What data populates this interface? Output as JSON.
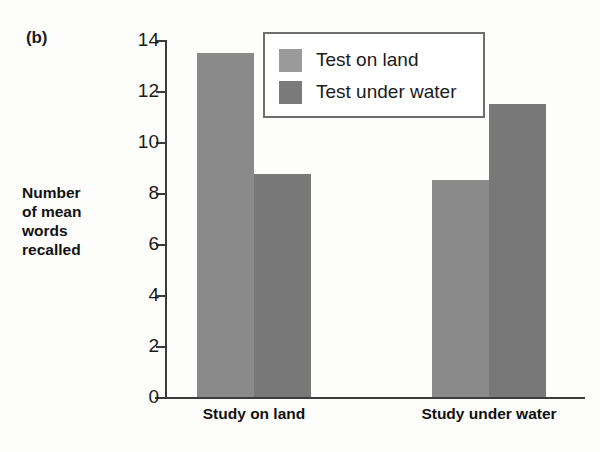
{
  "figure": {
    "panel_label": "(b)",
    "y_axis_title_lines": [
      "Number",
      "of mean",
      "words",
      "recalled"
    ]
  },
  "chart_data": {
    "type": "bar",
    "title": "",
    "xlabel": "",
    "ylabel": "Number of mean words recalled",
    "categories": [
      "Study on land",
      "Study under water"
    ],
    "series": [
      {
        "name": "Test on land",
        "values": [
          13.5,
          8.5
        ],
        "color": "#8a8a8a"
      },
      {
        "name": "Test under water",
        "values": [
          8.75,
          11.5
        ],
        "color": "#787878"
      }
    ],
    "ylim": [
      0,
      14
    ],
    "yticks": [
      0,
      2,
      4,
      6,
      8,
      10,
      12,
      14
    ],
    "ytick_labels": [
      "0",
      "2",
      "4",
      "6",
      "8",
      "10",
      "12",
      "14"
    ],
    "grid": false,
    "legend_position": "top-center",
    "legend_entries": [
      "Test on land",
      "Test under water"
    ]
  },
  "colors": {
    "axis": "#3b3b3b",
    "text": "#111111",
    "legend_border": "#6e6e6e",
    "bar_light": "#8a8a8a",
    "bar_dark": "#787878",
    "legend_swatch_light": "#9a9a9a",
    "legend_swatch_dark": "#7a7a7a"
  }
}
